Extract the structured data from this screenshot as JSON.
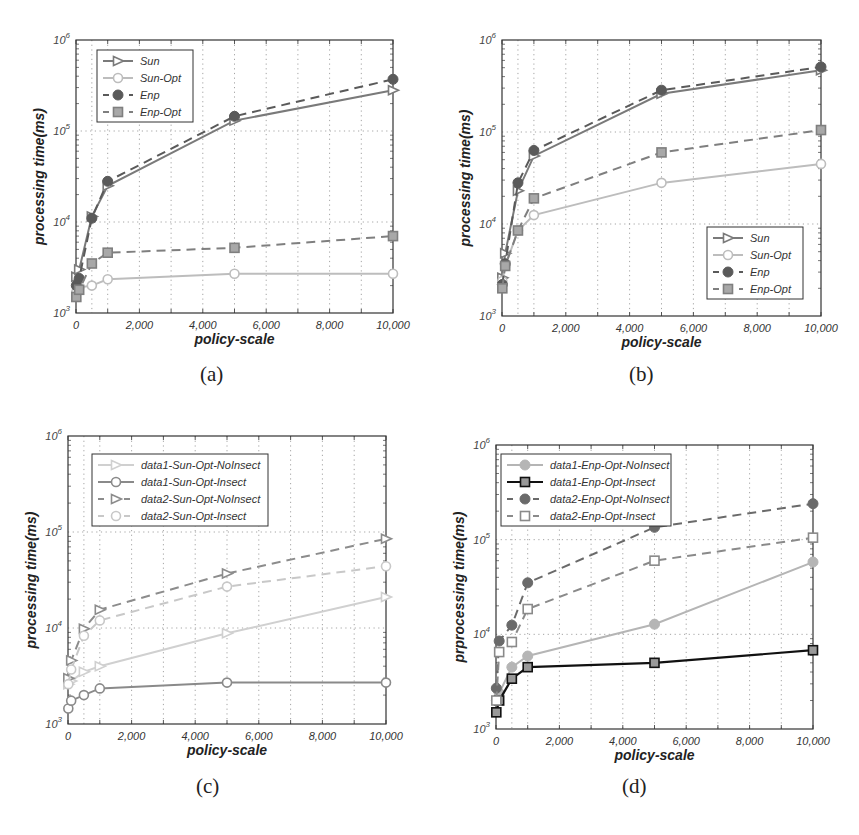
{
  "chart_data": [
    {
      "id": "a",
      "type": "line",
      "caption": "(a)",
      "title": "",
      "xlabel": "policy-scale",
      "ylabel": "processing time(ms)",
      "xscale": "linear",
      "yscale": "log",
      "xlim": [
        0,
        10000
      ],
      "ylim": [
        1000,
        1000000
      ],
      "xticks": [
        "0",
        "2,000",
        "4,000",
        "6,000",
        "8,000",
        "10,000"
      ],
      "yticks": [
        "10^3",
        "10^4",
        "10^5",
        "10^6"
      ],
      "grid": true,
      "legend_position": "upper-left",
      "x": [
        10,
        100,
        500,
        1000,
        5000,
        10000
      ],
      "series": [
        {
          "name": "Sun",
          "style": "solid",
          "marker": "triangle-right",
          "color": "#7a7a7a",
          "values": [
            2500,
            3000,
            11500,
            25000,
            130000,
            280000
          ]
        },
        {
          "name": "Sun-Opt",
          "style": "solid",
          "marker": "circle-open",
          "color": "#bdbdbd",
          "values": [
            1700,
            1900,
            2000,
            2350,
            2700,
            2700
          ]
        },
        {
          "name": "Enp",
          "style": "dashed",
          "marker": "circle-filled",
          "color": "#5a5a5a",
          "values": [
            2000,
            2400,
            11000,
            28000,
            145000,
            370000
          ]
        },
        {
          "name": "Enp-Opt",
          "style": "dashed",
          "marker": "square",
          "color": "#7f7f7f",
          "values": [
            1500,
            1800,
            3500,
            4600,
            5200,
            7000
          ]
        }
      ]
    },
    {
      "id": "b",
      "type": "line",
      "caption": "(b)",
      "title": "",
      "xlabel": "policy-scale",
      "ylabel": "processing time(ms)",
      "xscale": "linear",
      "yscale": "log",
      "xlim": [
        0,
        10000
      ],
      "ylim": [
        1000,
        1000000
      ],
      "xticks": [
        "0",
        "2,000",
        "4,000",
        "6,000",
        "8,000",
        "10,000"
      ],
      "yticks": [
        "10^3",
        "10^4",
        "10^5",
        "10^6"
      ],
      "grid": true,
      "legend_position": "lower-right",
      "x": [
        10,
        100,
        500,
        1000,
        5000,
        10000
      ],
      "series": [
        {
          "name": "Sun",
          "style": "solid",
          "marker": "triangle-right",
          "color": "#7a7a7a",
          "values": [
            2600,
            4800,
            23000,
            55000,
            260000,
            470000
          ]
        },
        {
          "name": "Sun-Opt",
          "style": "solid",
          "marker": "circle-open",
          "color": "#bdbdbd",
          "values": [
            2400,
            3500,
            8500,
            12500,
            28000,
            45000
          ]
        },
        {
          "name": "Enp",
          "style": "dashed",
          "marker": "circle-filled",
          "color": "#5a5a5a",
          "values": [
            2200,
            3700,
            28000,
            63000,
            285000,
            510000
          ]
        },
        {
          "name": "Enp-Opt",
          "style": "dashed",
          "marker": "square",
          "color": "#7f7f7f",
          "values": [
            2000,
            3500,
            8500,
            19000,
            60000,
            105000
          ]
        }
      ]
    },
    {
      "id": "c",
      "type": "line",
      "caption": "(c)",
      "title": "",
      "xlabel": "policy-scale",
      "ylabel": "processing time(ms)",
      "xscale": "linear",
      "yscale": "log",
      "xlim": [
        0,
        10000
      ],
      "ylim": [
        1000,
        1000000
      ],
      "xticks": [
        "0",
        "2,000",
        "4,000",
        "6,000",
        "8,000",
        "10,000"
      ],
      "yticks": [
        "10^3",
        "10^4",
        "10^5",
        "10^6"
      ],
      "grid": true,
      "legend_position": "upper-left",
      "x": [
        10,
        100,
        500,
        1000,
        5000,
        10000
      ],
      "series": [
        {
          "name": "data1-Sun-Opt-NoInsect",
          "style": "solid",
          "marker": "triangle-right",
          "color": "#d0d0d0",
          "values": [
            2600,
            2800,
            3500,
            4000,
            8800,
            21000
          ]
        },
        {
          "name": "data1-Sun-Opt-Insect",
          "style": "solid",
          "marker": "circle-open",
          "color": "#8a8a8a",
          "values": [
            1450,
            1750,
            2000,
            2350,
            2700,
            2700
          ]
        },
        {
          "name": "data2-Sun-Opt-NoInsect",
          "style": "dashed",
          "marker": "triangle-right",
          "color": "#8c8c8c",
          "values": [
            3000,
            4600,
            9800,
            15500,
            37000,
            85000
          ]
        },
        {
          "name": "data2-Sun-Opt-Insect",
          "style": "dashed",
          "marker": "circle-open",
          "color": "#c8c8c8",
          "values": [
            2600,
            3700,
            8300,
            12000,
            27000,
            44000
          ]
        }
      ]
    },
    {
      "id": "d",
      "type": "line",
      "caption": "(d)",
      "title": "",
      "xlabel": "policy-scale",
      "ylabel": "prprocessing time(ms)",
      "xscale": "linear",
      "yscale": "log",
      "xlim": [
        0,
        10000
      ],
      "ylim": [
        1000,
        1000000
      ],
      "xticks": [
        "0",
        "2,000",
        "4,000",
        "6,000",
        "8,000",
        "10,000"
      ],
      "yticks": [
        "10^3",
        "10^4",
        "10^5",
        "10^6"
      ],
      "grid": true,
      "legend_position": "upper-left",
      "x": [
        10,
        100,
        500,
        1000,
        5000,
        10000
      ],
      "series": [
        {
          "name": "data1-Enp-Opt-NoInsect",
          "style": "solid",
          "marker": "circle-filled",
          "color": "#b5b5b5",
          "values": [
            2000,
            2400,
            4500,
            5900,
            12800,
            58000
          ]
        },
        {
          "name": "data1-Enp-Opt-Insect",
          "style": "solid",
          "marker": "square",
          "color": "#111111",
          "values": [
            1500,
            2000,
            3400,
            4500,
            5000,
            6800
          ]
        },
        {
          "name": "data2-Enp-Opt-NoInsect",
          "style": "dashed",
          "marker": "circle-filled",
          "color": "#6a6a6a",
          "values": [
            2700,
            8500,
            12500,
            35000,
            135000,
            240000
          ]
        },
        {
          "name": "data2-Enp-Opt-Insect",
          "style": "dashed",
          "marker": "square-open",
          "color": "#8a8a8a",
          "values": [
            2000,
            6500,
            8300,
            18500,
            60000,
            105000
          ]
        }
      ]
    }
  ],
  "captions": {
    "a": "(a)",
    "b": "(b)",
    "c": "(c)",
    "d": "(d)"
  }
}
